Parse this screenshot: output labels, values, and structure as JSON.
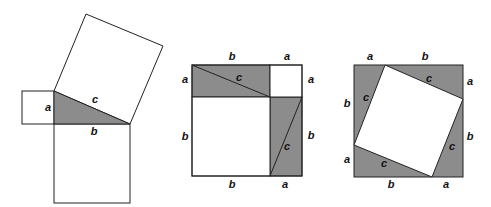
{
  "shade_color": "#8c8c8c",
  "figures": [
    {
      "name": "squares-on-sides",
      "labels": {
        "a": "a",
        "b": "b",
        "c": "c"
      }
    },
    {
      "name": "rearrangement-a2-b2",
      "labels": {
        "top_b": "b",
        "top_a": "a",
        "left_a": "a",
        "left_b": "b",
        "right_a": "a",
        "right_b": "b",
        "bottom_b": "b",
        "bottom_a": "a",
        "c_top": "c",
        "c_right": "c"
      }
    },
    {
      "name": "rearrangement-c2",
      "labels": {
        "top_a": "a",
        "top_b": "b",
        "left_b": "b",
        "left_a": "a",
        "right_a": "a",
        "right_b": "b",
        "bottom_b": "b",
        "bottom_a": "a",
        "c_top": "c",
        "c_left": "c",
        "c_right": "c",
        "c_bottom": "c"
      }
    }
  ]
}
